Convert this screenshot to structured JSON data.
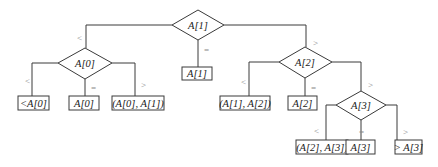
{
  "diagram": {
    "type": "decision-tree",
    "colors": {
      "line": "#3a3a3a",
      "text": "#1a1a1a",
      "edge_label": "#888888",
      "background": "#ffffff"
    },
    "decision_nodes": [
      {
        "id": "n1",
        "label": "A[1]"
      },
      {
        "id": "n0",
        "label": "A[0]"
      },
      {
        "id": "n2",
        "label": "A[2]"
      },
      {
        "id": "n3",
        "label": "A[3]"
      }
    ],
    "leaf_nodes": [
      {
        "id": "lt0",
        "label": "<A[0]"
      },
      {
        "id": "eq0",
        "label": "A[0]"
      },
      {
        "id": "b01",
        "label": "(A[0], A[1])"
      },
      {
        "id": "eq1",
        "label": "A[1]"
      },
      {
        "id": "b12",
        "label": "(A[1], A[2])"
      },
      {
        "id": "eq2",
        "label": "A[2]"
      },
      {
        "id": "b23",
        "label": "(A[2], A[3])"
      },
      {
        "id": "eq3",
        "label": "A[3]"
      },
      {
        "id": "gt3",
        "label": "> A[3]"
      }
    ],
    "edges": [
      {
        "from": "n1",
        "to": "n0",
        "label": "<"
      },
      {
        "from": "n1",
        "to": "eq1",
        "label": "="
      },
      {
        "from": "n1",
        "to": "n2",
        "label": ">"
      },
      {
        "from": "n0",
        "to": "lt0",
        "label": "<"
      },
      {
        "from": "n0",
        "to": "eq0",
        "label": "="
      },
      {
        "from": "n0",
        "to": "b01",
        "label": ">"
      },
      {
        "from": "n2",
        "to": "b12",
        "label": "<"
      },
      {
        "from": "n2",
        "to": "eq2",
        "label": "="
      },
      {
        "from": "n2",
        "to": "n3",
        "label": ">"
      },
      {
        "from": "n3",
        "to": "b23",
        "label": "<"
      },
      {
        "from": "n3",
        "to": "eq3",
        "label": "="
      },
      {
        "from": "n3",
        "to": "gt3",
        "label": ">"
      }
    ]
  }
}
